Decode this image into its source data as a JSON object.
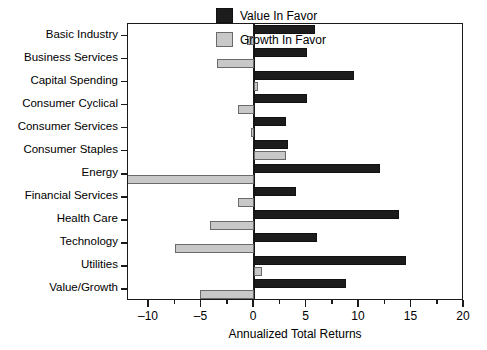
{
  "chart_data": {
    "type": "bar",
    "orientation": "horizontal",
    "title": "",
    "xlabel": "Annualized Total Returns",
    "ylabel": "",
    "xlim": [
      -12.8,
      20
    ],
    "xticks": [
      -10,
      -5,
      0,
      5,
      10,
      15,
      20
    ],
    "xtick_labels": [
      "–10",
      "–5",
      "0",
      "5",
      "10",
      "15",
      "20"
    ],
    "minor_tick_step": 2.5,
    "grid": false,
    "legend_position": "upper right",
    "categories": [
      "Basic Industry",
      "Business Services",
      "Capital Spending",
      "Consumer Cyclical",
      "Consumer Services",
      "Consumer Staples",
      "Energy",
      "Financial Services",
      "Health Care",
      "Technology",
      "Utilities",
      "Value/Growth"
    ],
    "series": [
      {
        "name": "Value In Favor",
        "color": "#1c1c1c",
        "values": [
          5.8,
          5.0,
          9.5,
          5.0,
          3.0,
          3.2,
          12.0,
          4.0,
          13.8,
          6.0,
          14.5,
          8.8
        ]
      },
      {
        "name": "Growth In Favor",
        "color": "#c8c8c8",
        "values": [
          -0.7,
          -3.5,
          0.4,
          -1.5,
          -0.3,
          3.0,
          -12.8,
          -1.5,
          -4.2,
          -7.5,
          0.8,
          -5.1
        ]
      }
    ]
  },
  "legend": {
    "items": [
      {
        "label": "Value In Favor",
        "swatch": "black-square"
      },
      {
        "label": "Growth In Favor",
        "swatch": "gray-square"
      }
    ]
  },
  "axis": {
    "x_title": "Annualized Total Returns"
  }
}
